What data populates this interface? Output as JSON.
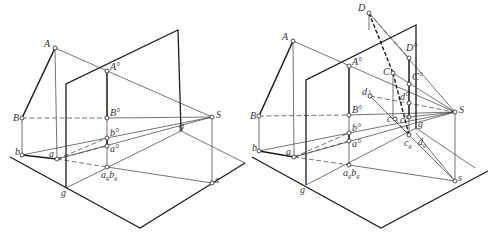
{
  "figure": {
    "left": {
      "ground_plane": [
        [
          10,
          157
        ],
        [
          140,
          228
        ],
        [
          245,
          163
        ]
      ],
      "picture_plane": [
        [
          66,
          188
        ],
        [
          66,
          84
        ],
        [
          178,
          30
        ],
        [
          181,
          131
        ]
      ],
      "picture_base": [
        [
          66,
          188
        ],
        [
          181,
          131
        ]
      ],
      "segments_thick": [
        [
          [
            55,
            48
          ],
          [
            22,
            118
          ]
        ],
        [
          [
            22,
            155
          ],
          [
            57,
            159
          ]
        ],
        [
          [
            107,
            71
          ],
          [
            107,
            118
          ]
        ],
        [
          [
            107,
            138
          ],
          [
            107,
            146
          ]
        ]
      ],
      "segments_thin": [
        [
          [
            55,
            48
          ],
          [
            212,
            117
          ]
        ],
        [
          [
            55,
            48
          ],
          [
            57,
            159
          ]
        ],
        [
          [
            22,
            118
          ],
          [
            22,
            155
          ]
        ],
        [
          [
            107,
            118
          ],
          [
            107,
            167
          ]
        ],
        [
          [
            212,
            117
          ],
          [
            212,
            183
          ]
        ],
        [
          [
            22,
            155
          ],
          [
            212,
            117
          ]
        ],
        [
          [
            57,
            159
          ],
          [
            212,
            117
          ]
        ],
        [
          [
            107,
            118
          ],
          [
            212,
            117
          ]
        ],
        [
          [
            107,
            167
          ],
          [
            212,
            183
          ]
        ],
        [
          [
            181,
            131
          ],
          [
            245,
            163
          ]
        ]
      ],
      "segments_dash": [
        [
          [
            22,
            118
          ],
          [
            107,
            118
          ]
        ],
        [
          [
            57,
            159
          ],
          [
            107,
            138
          ]
        ],
        [
          [
            57,
            159
          ],
          [
            107,
            146
          ]
        ],
        [
          [
            57,
            159
          ],
          [
            107,
            167
          ]
        ]
      ],
      "points": [
        {
          "id": "A",
          "x": 55,
          "y": 48,
          "label": "A",
          "lx": -11,
          "ly": -1
        },
        {
          "id": "B",
          "x": 22,
          "y": 118,
          "label": "B",
          "lx": -9,
          "ly": 3
        },
        {
          "id": "b",
          "x": 22,
          "y": 155,
          "label": "b",
          "lx": -7,
          "ly": 0
        },
        {
          "id": "a",
          "x": 57,
          "y": 159,
          "label": "a",
          "lx": -8,
          "ly": -2
        },
        {
          "id": "A0",
          "x": 107,
          "y": 71,
          "label": "A°",
          "lx": 3,
          "ly": -1
        },
        {
          "id": "B0",
          "x": 107,
          "y": 118,
          "label": "B°",
          "lx": 3,
          "ly": -2
        },
        {
          "id": "b0",
          "x": 107,
          "y": 138,
          "label": "b°",
          "lx": 3,
          "ly": -2
        },
        {
          "id": "a0",
          "x": 107,
          "y": 146,
          "label": "a°",
          "lx": 3,
          "ly": 6
        },
        {
          "id": "agbg",
          "x": 107,
          "y": 167,
          "label": "a",
          "sub": "g",
          "label2": "b",
          "sub2": "g",
          "lx": -6,
          "ly": 11
        },
        {
          "id": "S",
          "x": 212,
          "y": 117,
          "label": "S",
          "lx": 4,
          "ly": 1
        },
        {
          "id": "s",
          "x": 212,
          "y": 183,
          "label": "s",
          "lx": 3,
          "ly": 0
        },
        {
          "id": "g1",
          "x": 181,
          "y": 131,
          "label": "g",
          "lx": -2,
          "ly": -2,
          "nodot": true
        },
        {
          "id": "g2",
          "x": 66,
          "y": 188,
          "label": "g",
          "lx": -5,
          "ly": 8,
          "nodot": true
        }
      ]
    },
    "right": {
      "ground_plane": [
        [
          252,
          157
        ],
        [
          381,
          228
        ],
        [
          488,
          171
        ]
      ],
      "picture_plane": [
        [
          306,
          185
        ],
        [
          306,
          80
        ],
        [
          416,
          25
        ],
        [
          416,
          128
        ]
      ],
      "picture_base": [
        [
          306,
          185
        ],
        [
          416,
          128
        ]
      ],
      "segments_thick": [
        [
          [
            293,
            41
          ],
          [
            259,
            116
          ]
        ],
        [
          [
            259,
            151
          ],
          [
            294,
            157
          ]
        ],
        [
          [
            349,
            66
          ],
          [
            349,
            115
          ]
        ],
        [
          [
            349,
            133
          ],
          [
            349,
            141
          ]
        ],
        [
          [
            409,
            58
          ],
          [
            409,
            117
          ]
        ]
      ],
      "segments_thin": [
        [
          [
            293,
            41
          ],
          [
            455,
            112
          ]
        ],
        [
          [
            293,
            41
          ],
          [
            294,
            157
          ]
        ],
        [
          [
            259,
            116
          ],
          [
            259,
            151
          ]
        ],
        [
          [
            349,
            115
          ],
          [
            349,
            165
          ]
        ],
        [
          [
            455,
            112
          ],
          [
            455,
            181
          ]
        ],
        [
          [
            259,
            151
          ],
          [
            455,
            112
          ]
        ],
        [
          [
            294,
            157
          ],
          [
            455,
            112
          ]
        ],
        [
          [
            349,
            115
          ],
          [
            455,
            112
          ]
        ],
        [
          [
            349,
            165
          ],
          [
            455,
            181
          ]
        ],
        [
          [
            369,
            13
          ],
          [
            455,
            112
          ]
        ],
        [
          [
            393,
            73
          ],
          [
            455,
            112
          ]
        ],
        [
          [
            393,
            73
          ],
          [
            393,
            119
          ]
        ],
        [
          [
            409,
            117
          ],
          [
            455,
            112
          ]
        ],
        [
          [
            409,
            135
          ],
          [
            455,
            181
          ]
        ],
        [
          [
            416,
            133
          ],
          [
            455,
            181
          ]
        ],
        [
          [
            370,
            96
          ],
          [
            409,
            135
          ]
        ],
        [
          [
            409,
            117
          ],
          [
            409,
            135
          ]
        ],
        [
          [
            369,
            13
          ],
          [
            369,
            30
          ]
        ],
        [
          [
            370,
            90
          ],
          [
            370,
            96
          ]
        ],
        [
          [
            416,
            128
          ],
          [
            475,
            168
          ]
        ]
      ],
      "segments_dash": [
        [
          [
            259,
            116
          ],
          [
            349,
            115
          ]
        ],
        [
          [
            294,
            157
          ],
          [
            349,
            133
          ]
        ],
        [
          [
            294,
            157
          ],
          [
            349,
            141
          ]
        ],
        [
          [
            294,
            157
          ],
          [
            349,
            165
          ]
        ],
        [
          [
            370,
            96
          ],
          [
            455,
            112
          ]
        ],
        [
          [
            369,
            13
          ],
          [
            409,
            58
          ]
        ],
        [
          [
            395,
            119
          ],
          [
            409,
            135
          ]
        ],
        [
          [
            416,
            58
          ],
          [
            416,
            133
          ]
        ]
      ],
      "segments_dashthick": [
        [
          [
            369,
            13
          ],
          [
            393,
            73
          ]
        ],
        [
          [
            393,
            73
          ],
          [
            409,
            135
          ]
        ]
      ],
      "points": [
        {
          "id": "D",
          "x": 369,
          "y": 13,
          "label": "D",
          "lx": -11,
          "ly": -2
        },
        {
          "id": "D0",
          "x": 409,
          "y": 58,
          "label": "D°",
          "lx": -3,
          "ly": -7
        },
        {
          "id": "C",
          "x": 393,
          "y": 73,
          "label": "C",
          "lx": -10,
          "ly": 2
        },
        {
          "id": "C0",
          "x": 409,
          "y": 84,
          "label": "C°",
          "lx": 3,
          "ly": -4
        },
        {
          "id": "d",
          "x": 370,
          "y": 96,
          "label": "d",
          "lx": -8,
          "ly": -1
        },
        {
          "id": "d0",
          "x": 409,
          "y": 103,
          "label": "d°",
          "lx": -9,
          "ly": -3
        },
        {
          "id": "c",
          "x": 395,
          "y": 119,
          "label": "c",
          "lx": -8,
          "ly": 3
        },
        {
          "id": "c0",
          "x": 409,
          "y": 117,
          "label": "c°",
          "lx": -9,
          "ly": 6
        },
        {
          "id": "cg",
          "x": 409,
          "y": 135,
          "label": "c",
          "sub": "g",
          "lx": -5,
          "ly": 11
        },
        {
          "id": "dg",
          "x": 416,
          "y": 133,
          "label": "d",
          "sub": "g",
          "lx": 2,
          "ly": 12,
          "nodot": true
        },
        {
          "id": "A",
          "x": 293,
          "y": 41,
          "label": "A",
          "lx": -11,
          "ly": -1
        },
        {
          "id": "B",
          "x": 259,
          "y": 116,
          "label": "B",
          "lx": -9,
          "ly": 3
        },
        {
          "id": "b",
          "x": 259,
          "y": 151,
          "label": "b",
          "lx": -7,
          "ly": 0
        },
        {
          "id": "a",
          "x": 294,
          "y": 157,
          "label": "a",
          "lx": -8,
          "ly": -2
        },
        {
          "id": "A0",
          "x": 349,
          "y": 66,
          "label": "A°",
          "lx": 3,
          "ly": -1
        },
        {
          "id": "B0",
          "x": 349,
          "y": 115,
          "label": "B°",
          "lx": 3,
          "ly": -2
        },
        {
          "id": "b0",
          "x": 349,
          "y": 133,
          "label": "b°",
          "lx": 3,
          "ly": -2
        },
        {
          "id": "a0",
          "x": 349,
          "y": 141,
          "label": "a°",
          "lx": 3,
          "ly": 6
        },
        {
          "id": "agbg",
          "x": 349,
          "y": 165,
          "label": "a",
          "sub": "g",
          "label2": "b",
          "sub2": "g",
          "lx": -6,
          "ly": 11
        },
        {
          "id": "S",
          "x": 455,
          "y": 112,
          "label": "S",
          "lx": 4,
          "ly": 1
        },
        {
          "id": "s",
          "x": 455,
          "y": 181,
          "label": "s",
          "lx": 3,
          "ly": 0
        },
        {
          "id": "g1",
          "x": 416,
          "y": 128,
          "label": "g",
          "lx": 2,
          "ly": -1,
          "nodot": true
        },
        {
          "id": "g2",
          "x": 306,
          "y": 185,
          "label": "g",
          "lx": -6,
          "ly": 8,
          "nodot": true
        }
      ]
    }
  }
}
